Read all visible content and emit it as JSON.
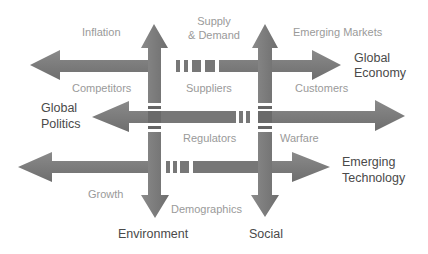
{
  "diagram": {
    "colors": {
      "arrow": "#7a7a7a",
      "arrow_dark": "#666666",
      "label": "#9a9a9a",
      "heading": "#4a4a4a",
      "background": "#ffffff"
    },
    "axes": {
      "global_economy": "Global\nEconomy",
      "global_politics": "Global\nPolitics",
      "emerging_technology": "Emerging\nTechnology",
      "environment": "Environment",
      "social": "Social"
    },
    "axis_lines": {
      "global_economy_1": "Global",
      "global_economy_2": "Economy",
      "global_politics_1": "Global",
      "global_politics_2": "Politics",
      "emerging_technology_1": "Emerging",
      "emerging_technology_2": "Technology",
      "environment": "Environment",
      "social": "Social"
    },
    "factors": {
      "inflation": "Inflation",
      "supply_demand_1": "Supply",
      "supply_demand_2": "& Demand",
      "emerging_markets": "Emerging Markets",
      "competitors": "Competitors",
      "suppliers": "Suppliers",
      "customers": "Customers",
      "regulators": "Regulators",
      "warfare": "Warfare",
      "growth": "Growth",
      "demographics": "Demographics"
    }
  }
}
